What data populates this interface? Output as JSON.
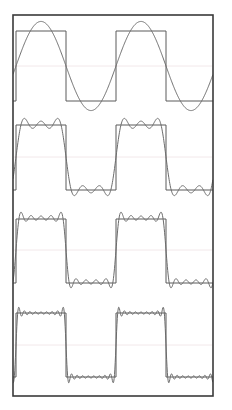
{
  "figure": {
    "title": "",
    "background_color": "#ffffff",
    "frame": {
      "x": 13,
      "y": 15,
      "width": 200,
      "height": 381,
      "stroke": "#3a3a3a",
      "stroke_width": 1.6
    },
    "curve_color": "#6b6b6b",
    "square_color": "#5a5a5a",
    "zero_line_color": "#f2e8ea",
    "curve_stroke_width": 1.0
  },
  "chart_data": {
    "type": "line",
    "xlabel": "",
    "ylabel": "",
    "xlim": [
      0,
      2.0
    ],
    "ylim": [
      -1.55,
      1.55
    ],
    "grid": false,
    "legend_position": "none",
    "panels": [
      {
        "index": 1,
        "label": "1 harmonic",
        "n_terms": 1,
        "harmonics": [
          1
        ],
        "ripples_per_half_cycle": 0,
        "plot_y_top": 16,
        "plot_y_bottom": 110,
        "zero_line_y": 66,
        "square_high_y": 31,
        "square_low_y": 101,
        "series": [
          {
            "name": "square wave",
            "kind": "square",
            "amplitude": 1.0
          },
          {
            "name": "partial sum",
            "kind": "fourier",
            "amplitude": 1.273
          }
        ]
      },
      {
        "index": 2,
        "label": "3 harmonics",
        "n_terms": 3,
        "harmonics": [
          1,
          3,
          5
        ],
        "ripples_per_half_cycle": 2,
        "plot_y_top": 110,
        "plot_y_bottom": 205,
        "zero_line_y": 157,
        "square_high_y": 125,
        "square_low_y": 190,
        "series": [
          {
            "name": "square wave",
            "kind": "square",
            "amplitude": 1.0
          },
          {
            "name": "partial sum",
            "kind": "fourier",
            "amplitude": 1.1
          }
        ]
      },
      {
        "index": 3,
        "label": "5 harmonics",
        "n_terms": 5,
        "harmonics": [
          1,
          3,
          5,
          7,
          9
        ],
        "ripples_per_half_cycle": 3,
        "plot_y_top": 205,
        "plot_y_bottom": 298,
        "zero_line_y": 250,
        "square_high_y": 219,
        "square_low_y": 283,
        "series": [
          {
            "name": "square wave",
            "kind": "square",
            "amplitude": 1.0
          },
          {
            "name": "partial sum",
            "kind": "fourier",
            "amplitude": 1.08
          }
        ]
      },
      {
        "index": 4,
        "label": "9 harmonics",
        "n_terms": 9,
        "harmonics": [
          1,
          3,
          5,
          7,
          9,
          11,
          13,
          15,
          17
        ],
        "ripples_per_half_cycle": 4,
        "plot_y_top": 298,
        "plot_y_bottom": 395,
        "zero_line_y": 345,
        "square_high_y": 313,
        "square_low_y": 377,
        "series": [
          {
            "name": "square wave",
            "kind": "square",
            "amplitude": 1.0
          },
          {
            "name": "partial sum",
            "kind": "fourier",
            "amplitude": 1.06
          }
        ]
      }
    ],
    "square_wave": {
      "period_px": 100,
      "x_start_px": 16,
      "cycles_visible": 2.1,
      "duty_cycle": 0.5
    }
  }
}
